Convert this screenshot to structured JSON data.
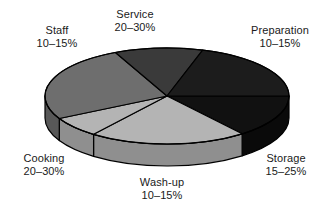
{
  "chart_data": {
    "type": "pie",
    "title": "",
    "three_d": true,
    "legend_position": "none",
    "labels_position": "outside",
    "categories": [
      "Preparation",
      "Storage",
      "Wash-up",
      "Cooking",
      "Staff",
      "Service"
    ],
    "value_labels": [
      "10–15%",
      "15–25%",
      "10–15%",
      "20–30%",
      "10–15%",
      "20–30%"
    ],
    "values": [
      12.5,
      20,
      12.5,
      25,
      12.5,
      25
    ],
    "ranges": [
      {
        "category": "Preparation",
        "min": 10,
        "max": 15,
        "unit": "%"
      },
      {
        "category": "Storage",
        "min": 15,
        "max": 25,
        "unit": "%"
      },
      {
        "category": "Wash-up",
        "min": 10,
        "max": 15,
        "unit": "%"
      },
      {
        "category": "Cooking",
        "min": 20,
        "max": 30,
        "unit": "%"
      },
      {
        "category": "Staff",
        "min": 10,
        "max": 15,
        "unit": "%"
      },
      {
        "category": "Service",
        "min": 20,
        "max": 30,
        "unit": "%"
      }
    ],
    "slice_colors": [
      "#111111",
      "#b4b4b4",
      "#b4b4b4",
      "#6e6e6e",
      "#3a3a3a",
      "#1c1c1c"
    ],
    "side_colors": [
      "#0a0a0a",
      "#8f8f8f",
      "#8f8f8f",
      "#585858",
      "#2c2c2c",
      "#141414"
    ],
    "outline_color": "#000000",
    "background_color": "#ffffff"
  },
  "labels": {
    "service": {
      "name": "Service",
      "value": "20–30%"
    },
    "preparation": {
      "name": "Preparation",
      "value": "10–15%"
    },
    "staff": {
      "name": "Staff",
      "value": "10–15%"
    },
    "cooking": {
      "name": "Cooking",
      "value": "20–30%"
    },
    "washup": {
      "name": "Wash-up",
      "value": "10–15%"
    },
    "storage": {
      "name": "Storage",
      "value": "15–25%"
    }
  }
}
